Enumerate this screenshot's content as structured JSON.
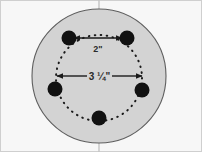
{
  "figure": {
    "canvas": {
      "width": 202,
      "height": 152,
      "background_color": "#f7f7f7"
    },
    "border_color": "#c9c9c9",
    "hub_face": {
      "name": "wheel-hub-face",
      "center_x": 99,
      "center_y": 76,
      "radius": 67,
      "fill_color": "#d2d2d2",
      "stroke_color": "#5a5a5a"
    },
    "bolt_circle": {
      "name": "bolt-circle",
      "center_x": 99,
      "center_y": 78,
      "radius": 43,
      "style": "dotted",
      "dot_color": "#1a1a1a",
      "diameter_label": "3 ¼\"",
      "diameter_value": 3.25,
      "units": "inches",
      "lug_count": 5
    },
    "center_line": {
      "name": "vertical-center-line",
      "x": 99,
      "color": "#bdbdbd"
    },
    "lugs": [
      {
        "name": "lug-hole-top-left",
        "cx": 69,
        "cy": 38,
        "r": 7.5,
        "color": "#111111"
      },
      {
        "name": "lug-hole-top-right",
        "cx": 127,
        "cy": 38,
        "r": 7.5,
        "color": "#111111"
      },
      {
        "name": "lug-hole-left",
        "cx": 55,
        "cy": 89,
        "r": 7.5,
        "color": "#111111"
      },
      {
        "name": "lug-hole-right",
        "cx": 142,
        "cy": 90,
        "r": 7.5,
        "color": "#111111"
      },
      {
        "name": "lug-hole-bottom",
        "cx": 99,
        "cy": 118,
        "r": 7.5,
        "color": "#111111"
      }
    ],
    "dimensions": [
      {
        "name": "lug-spacing-dimension",
        "label": "2\"",
        "value": 2,
        "units": "inches",
        "description": "center-to-center spacing between adjacent top lug holes",
        "x1": 73,
        "y1": 38,
        "x2": 123,
        "y2": 38,
        "label_x": 98,
        "label_y": 50,
        "color": "#1a1a1a"
      },
      {
        "name": "bolt-circle-diameter-dimension",
        "label": "3 ¼\"",
        "value": 3.25,
        "units": "inches",
        "description": "bolt circle diameter across the dotted circle",
        "x1": 57,
        "y1": 76,
        "x2": 142,
        "y2": 76,
        "label_x": 99,
        "label_y": 79,
        "color": "#1a1a1a"
      }
    ]
  }
}
